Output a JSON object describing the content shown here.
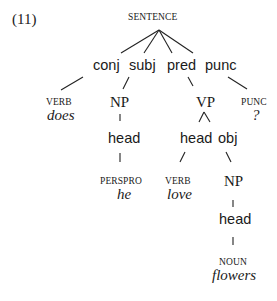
{
  "example_number": "(11)",
  "tree": {
    "root": "SENTENCE",
    "functions": {
      "conj": "conj",
      "subj": "subj",
      "pred": "pred",
      "punc": "punc"
    },
    "conj_branch": {
      "category": "VERB",
      "word": "does"
    },
    "subj_branch": {
      "phrase": "NP",
      "function": "head",
      "category": "PERSPRO",
      "word": "he"
    },
    "pred_branch": {
      "phrase": "VP",
      "head": {
        "function": "head",
        "category": "VERB",
        "word": "love"
      },
      "obj": {
        "function": "obj",
        "phrase": "NP",
        "sub_function": "head",
        "category": "NOUN",
        "word": "flowers"
      }
    },
    "punc_branch": {
      "category": "PUNC",
      "word": "?"
    }
  },
  "colors": {
    "ink": "#1a1a1a",
    "background": "#ffffff"
  }
}
